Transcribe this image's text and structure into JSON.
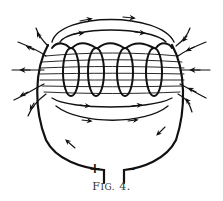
{
  "figure": {
    "caption_prefix": "F",
    "caption_rest": "IG.",
    "caption_number": "4.",
    "terminals": {
      "positive": "+",
      "negative": "–"
    },
    "coil_turns": 4,
    "colors": {
      "ink": "#111111",
      "background": "#ffffff"
    }
  }
}
